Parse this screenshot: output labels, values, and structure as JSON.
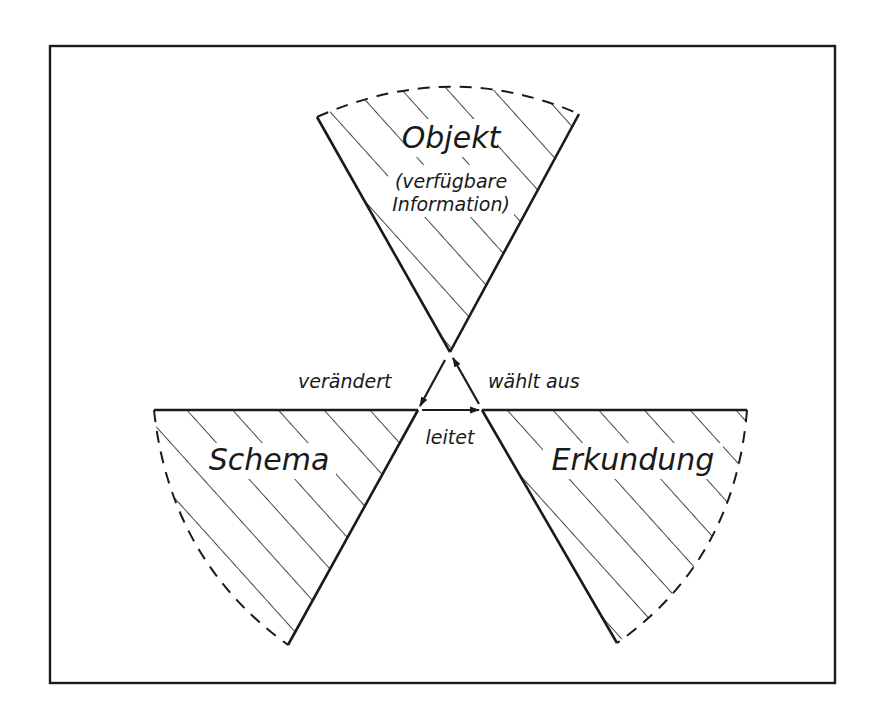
{
  "diagram": {
    "sectors": {
      "objekt": {
        "title": "Objekt",
        "subtitle_line1": "(verfügbare",
        "subtitle_line2": "Information)"
      },
      "schema": {
        "title": "Schema"
      },
      "erkundung": {
        "title": "Erkundung"
      }
    },
    "arrows": {
      "veraendert": "verändert",
      "waehlt_aus": "wählt aus",
      "leitet": "leitet"
    }
  },
  "colors": {
    "ink": "#1a1a1a",
    "background": "#ffffff"
  }
}
